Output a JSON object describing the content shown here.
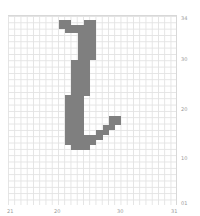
{
  "chart_data": {
    "type": "heatmap",
    "title": "",
    "xlabel": "",
    "ylabel": "",
    "grid": true,
    "cell_color": "#7f7f7f",
    "grid_color": "#e3e3e3",
    "y_ticks": [
      "34",
      "30",
      "20",
      "10",
      "01"
    ],
    "x_ticks": [
      "21",
      "20",
      "30",
      "31"
    ],
    "filled_regions_px": [
      {
        "x": 59,
        "y": 20,
        "w": 12,
        "h": 9
      },
      {
        "x": 65,
        "y": 25,
        "w": 20,
        "h": 8
      },
      {
        "x": 84,
        "y": 20,
        "w": 12,
        "h": 40
      },
      {
        "x": 78,
        "y": 29,
        "w": 18,
        "h": 31
      },
      {
        "x": 71,
        "y": 60,
        "w": 19,
        "h": 36
      },
      {
        "x": 65,
        "y": 95,
        "w": 19,
        "h": 50
      },
      {
        "x": 71,
        "y": 145,
        "w": 19,
        "h": 5
      },
      {
        "x": 84,
        "y": 135,
        "w": 12,
        "h": 10
      },
      {
        "x": 90,
        "y": 140,
        "w": 6,
        "h": 5
      },
      {
        "x": 96,
        "y": 130,
        "w": 7,
        "h": 10
      },
      {
        "x": 103,
        "y": 125,
        "w": 6,
        "h": 10
      },
      {
        "x": 109,
        "y": 120,
        "w": 6,
        "h": 10
      },
      {
        "x": 109,
        "y": 116,
        "w": 12,
        "h": 9
      }
    ]
  },
  "axes": {
    "y_labels": [
      {
        "text": "34",
        "top": 15
      },
      {
        "text": "30",
        "top": 56
      },
      {
        "text": "20",
        "top": 106
      },
      {
        "text": "10",
        "top": 155
      },
      {
        "text": "01",
        "top": 200
      }
    ],
    "x_labels": [
      {
        "text": "21",
        "left": 7
      },
      {
        "text": "20",
        "left": 54
      },
      {
        "text": "30",
        "left": 117
      },
      {
        "text": "31",
        "left": 171
      }
    ]
  }
}
